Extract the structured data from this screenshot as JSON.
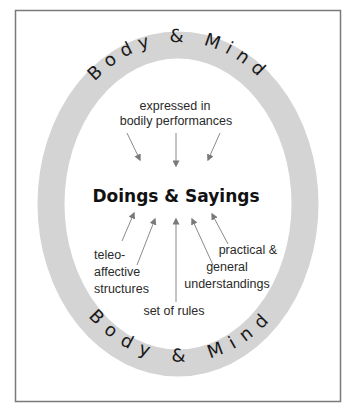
{
  "diagram": {
    "title": "Doings & Sayings",
    "ring": {
      "top_text": "Body & Mind",
      "bottom_text": "Body & Mind",
      "color": "#d4d4d4"
    },
    "labels": {
      "top_line1": "expressed in",
      "top_line2": "bodily performances",
      "left_line1": "teleo-",
      "left_line2": "affective",
      "left_line3": "structures",
      "bottom": "set of rules",
      "right_line1": "practical &",
      "right_line2": "general",
      "right_line3": "understandings"
    },
    "arrows": [
      {
        "from": "top-left",
        "to": "center"
      },
      {
        "from": "top",
        "to": "center"
      },
      {
        "from": "top-right",
        "to": "center"
      },
      {
        "from": "teleo-affective structures",
        "to": "center"
      },
      {
        "from": "teleo-affective structures",
        "to": "center"
      },
      {
        "from": "set of rules",
        "to": "center"
      },
      {
        "from": "practical & general understandings",
        "to": "center"
      },
      {
        "from": "practical & general understandings",
        "to": "center"
      }
    ]
  }
}
